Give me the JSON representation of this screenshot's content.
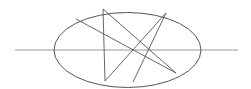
{
  "diagram": {
    "width": 251,
    "height": 89,
    "stroke_color": "#555555",
    "axis_color": "#999999",
    "ellipse": {
      "cx": 127.5,
      "cy": 50,
      "rx": 73.5,
      "ry": 37.5
    },
    "axis_line": {
      "x1": 15,
      "y1": 50,
      "x2": 238,
      "y2": 50
    },
    "points": {
      "A": [
        76,
        19
      ],
      "B": [
        103,
        9
      ],
      "C": [
        166,
        13
      ],
      "D": [
        176,
        73
      ],
      "E": [
        133,
        82
      ],
      "F": [
        105,
        81
      ]
    },
    "chords": [
      [
        "A",
        "D"
      ],
      [
        "B",
        "D"
      ],
      [
        "B",
        "F"
      ],
      [
        "C",
        "F"
      ],
      [
        "C",
        "E"
      ]
    ]
  }
}
